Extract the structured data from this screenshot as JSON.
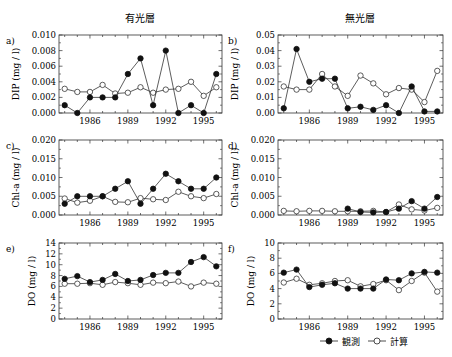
{
  "figure": {
    "column_titles": [
      "有光層",
      "無光層"
    ],
    "legend": [
      {
        "label": "観測",
        "marker": "filled-circle"
      },
      {
        "label": "計算",
        "marker": "open-circle"
      }
    ]
  },
  "chart_data": [
    {
      "panel": "a)",
      "type": "line",
      "column": "有光層",
      "ylabel": "DIP (mg / l)",
      "xlabel": "",
      "x": [
        1984,
        1985,
        1986,
        1987,
        1988,
        1989,
        1990,
        1991,
        1992,
        1993,
        1994,
        1995,
        1996
      ],
      "xticks": [
        1986,
        1989,
        1992,
        1995
      ],
      "ylim": [
        0,
        0.01
      ],
      "yticks": [
        "0.000",
        "0.002",
        "0.004",
        "0.006",
        "0.008",
        "0.010"
      ],
      "series": [
        {
          "name": "観測",
          "values": [
            0.001,
            0.0,
            0.002,
            0.002,
            0.002,
            0.005,
            0.007,
            0.001,
            0.008,
            0.0,
            0.001,
            0.0,
            0.005
          ]
        },
        {
          "name": "計算",
          "values": [
            0.0031,
            0.0027,
            0.0027,
            0.0036,
            0.0025,
            0.0026,
            0.0033,
            0.0026,
            0.003,
            0.0031,
            0.004,
            0.0022,
            0.0033
          ]
        }
      ]
    },
    {
      "panel": "b)",
      "type": "line",
      "column": "無光層",
      "ylabel": "DIP (mg / l)",
      "xlabel": "",
      "x": [
        1984,
        1985,
        1986,
        1987,
        1988,
        1989,
        1990,
        1991,
        1992,
        1993,
        1994,
        1995,
        1996
      ],
      "xticks": [
        1986,
        1989,
        1992,
        1995
      ],
      "ylim": [
        0,
        0.05
      ],
      "yticks": [
        "0.00",
        "0.01",
        "0.02",
        "0.03",
        "0.04",
        "0.05"
      ],
      "series": [
        {
          "name": "観測",
          "values": [
            0.003,
            0.041,
            0.02,
            0.022,
            0.022,
            0.003,
            0.004,
            0.002,
            0.005,
            0.0,
            0.017,
            0.001,
            0.001
          ]
        },
        {
          "name": "計算",
          "values": [
            0.017,
            0.015,
            0.015,
            0.025,
            0.017,
            0.011,
            0.024,
            0.019,
            0.012,
            0.016,
            0.015,
            0.007,
            0.027
          ]
        }
      ]
    },
    {
      "panel": "c)",
      "type": "line",
      "column": "有光層",
      "ylabel": "Chl-a (mg / l)",
      "xlabel": "",
      "x": [
        1984,
        1985,
        1986,
        1987,
        1988,
        1989,
        1990,
        1991,
        1992,
        1993,
        1994,
        1995,
        1996
      ],
      "xticks": [
        1986,
        1989,
        1992,
        1995
      ],
      "ylim": [
        0,
        0.02
      ],
      "yticks": [
        "0.000",
        "0.005",
        "0.010",
        "0.015",
        "0.020"
      ],
      "series": [
        {
          "name": "観測",
          "values": [
            0.003,
            0.005,
            0.005,
            0.005,
            0.007,
            0.009,
            0.003,
            0.007,
            0.011,
            0.009,
            0.007,
            0.007,
            0.01
          ]
        },
        {
          "name": "計算",
          "values": [
            0.0044,
            0.0033,
            0.0038,
            0.005,
            0.0035,
            0.0034,
            0.0045,
            0.0042,
            0.004,
            0.0062,
            0.005,
            0.0045,
            0.0056
          ]
        }
      ]
    },
    {
      "panel": "d)",
      "type": "line",
      "column": "無光層",
      "ylabel": "Chl-a (mg / l)",
      "xlabel": "",
      "x": [
        1984,
        1985,
        1986,
        1987,
        1988,
        1989,
        1990,
        1991,
        1992,
        1993,
        1994,
        1995,
        1996
      ],
      "xticks": [
        1986,
        1989,
        1992,
        1995
      ],
      "ylim": [
        0,
        0.02
      ],
      "yticks": [
        "0.000",
        "0.005",
        "0.010",
        "0.015",
        "0.020"
      ],
      "series": [
        {
          "name": "観測",
          "values": [
            null,
            null,
            null,
            null,
            null,
            0.0017,
            0.0008,
            0.0007,
            0.0008,
            0.0017,
            0.0037,
            0.0017,
            0.0048
          ]
        },
        {
          "name": "計算",
          "values": [
            0.0011,
            0.001,
            0.0011,
            0.0011,
            0.001,
            0.001,
            0.001,
            0.0011,
            0.0008,
            0.0028,
            0.0015,
            0.0012,
            0.0019
          ]
        }
      ]
    },
    {
      "panel": "e)",
      "type": "line",
      "column": "有光層",
      "ylabel": "DO (mg / l)",
      "xlabel": "",
      "x": [
        1984,
        1985,
        1986,
        1987,
        1988,
        1989,
        1990,
        1991,
        1992,
        1993,
        1994,
        1995,
        1996
      ],
      "xticks": [
        1986,
        1989,
        1992,
        1995
      ],
      "ylim": [
        0,
        14
      ],
      "yticks": [
        "0",
        "2",
        "4",
        "6",
        "8",
        "10",
        "12",
        "14"
      ],
      "series": [
        {
          "name": "観測",
          "values": [
            7.4,
            7.9,
            6.8,
            7.2,
            8.3,
            7.0,
            7.2,
            8.1,
            8.5,
            8.5,
            10.5,
            11.4,
            9.7
          ]
        },
        {
          "name": "計算",
          "values": [
            6.5,
            6.5,
            6.6,
            6.3,
            6.8,
            6.6,
            6.3,
            6.7,
            6.6,
            6.9,
            6.0,
            6.7,
            6.5
          ]
        }
      ]
    },
    {
      "panel": "f)",
      "type": "line",
      "column": "無光層",
      "ylabel": "DO (mg / l)",
      "xlabel": "",
      "x": [
        1984,
        1985,
        1986,
        1987,
        1988,
        1989,
        1990,
        1991,
        1992,
        1993,
        1994,
        1995,
        1996
      ],
      "xticks": [
        1986,
        1989,
        1992,
        1995
      ],
      "ylim": [
        0,
        10
      ],
      "yticks": [
        "0",
        "2",
        "4",
        "6",
        "8",
        "10"
      ],
      "series": [
        {
          "name": "観測",
          "values": [
            6.1,
            6.5,
            4.2,
            4.5,
            4.7,
            4.0,
            4.0,
            4.0,
            5.2,
            5.1,
            6.0,
            6.2,
            6.1
          ]
        },
        {
          "name": "計算",
          "values": [
            4.8,
            5.3,
            4.5,
            4.7,
            5.0,
            5.1,
            4.3,
            4.6,
            5.1,
            3.8,
            5.0,
            6.1,
            3.6
          ]
        }
      ]
    }
  ]
}
